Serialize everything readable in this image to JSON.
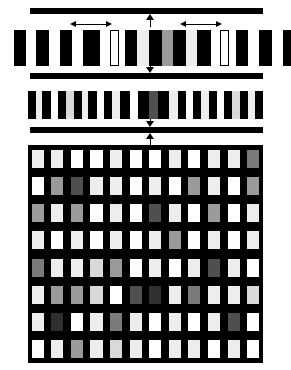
{
  "figure": {
    "background": "#ffffff",
    "width": 291,
    "height": 370,
    "palette": {
      "black": "#000000",
      "white": "#ffffff",
      "light_gray": "#d9d9d9",
      "pale_gray": "#ededed",
      "mid_gray": "#9a9a9a",
      "dark_gray": "#4f4f4f",
      "very_dark_gray": "#303030"
    }
  },
  "rule_bars": [
    {
      "name": "top-rule",
      "x": 30,
      "y": 8,
      "width": 233,
      "height": 6,
      "color": "#000000"
    },
    {
      "name": "mid-rule",
      "x": 30,
      "y": 73,
      "width": 233,
      "height": 6,
      "color": "#000000"
    },
    {
      "name": "low-rule",
      "x": 30,
      "y": 127,
      "width": 233,
      "height": 6,
      "color": "#000000"
    }
  ],
  "connectors": [
    {
      "name": "connector-top",
      "x": 146,
      "y": 14,
      "height": 13,
      "direction": "up"
    },
    {
      "name": "connector-middle",
      "x": 146,
      "y": 60,
      "height": 13,
      "direction": "down"
    },
    {
      "name": "connector-lower",
      "x": 146,
      "y": 113,
      "height": 14,
      "direction": "down"
    },
    {
      "name": "connector-grid",
      "x": 146,
      "y": 133,
      "height": 12,
      "direction": "up"
    }
  ],
  "span_arrows": [
    {
      "name": "span-arrow-left",
      "x": 70,
      "y": 21,
      "width": 42,
      "label": ""
    },
    {
      "name": "span-arrow-right",
      "x": 180,
      "y": 21,
      "width": 42,
      "label": ""
    }
  ],
  "row1": {
    "name": "coarse-stripe-row",
    "y": 30,
    "height": 36,
    "groups": [
      {
        "name": "row1-group-left",
        "x": 14,
        "width": 86,
        "bars": [
          {
            "w": 12,
            "color": "#000000"
          },
          {
            "w": 10,
            "color": "#ffffff"
          },
          {
            "w": 13,
            "color": "#000000"
          },
          {
            "w": 11,
            "color": "#ffffff"
          },
          {
            "w": 12,
            "color": "#000000"
          },
          {
            "w": 11,
            "color": "#ffffff"
          },
          {
            "w": 17,
            "color": "#000000"
          }
        ]
      },
      {
        "name": "row1-outline-bar-left",
        "x": 110,
        "width": 9,
        "outlined": true
      },
      {
        "name": "row1-group-center",
        "x": 125,
        "width": 86,
        "bars": [
          {
            "w": 12,
            "color": "#000000"
          },
          {
            "w": 12,
            "color": "#ededed"
          },
          {
            "w": 13,
            "color": "#000000"
          },
          {
            "w": 11,
            "color": "#9a9a9a"
          },
          {
            "w": 13,
            "color": "#000000"
          },
          {
            "w": 11,
            "color": "#ededed"
          },
          {
            "w": 14,
            "color": "#000000"
          }
        ]
      },
      {
        "name": "row1-outline-bar-right",
        "x": 220,
        "width": 9,
        "outlined": true
      },
      {
        "name": "row1-group-right",
        "x": 236,
        "width": 86,
        "bars": [
          {
            "w": 12,
            "color": "#000000"
          },
          {
            "w": 11,
            "color": "#ffffff"
          },
          {
            "w": 13,
            "color": "#000000"
          },
          {
            "w": 11,
            "color": "#ffffff"
          },
          {
            "w": 12,
            "color": "#000000"
          },
          {
            "w": 11,
            "color": "#d9d9d9"
          },
          {
            "w": 16,
            "color": "#000000"
          }
        ]
      }
    ]
  },
  "row2": {
    "name": "medium-stripe-row",
    "x": 28,
    "y": 91,
    "width": 235,
    "height": 28,
    "bars": [
      {
        "w": 8,
        "color": "#000000"
      },
      {
        "w": 7,
        "color": "#ededed"
      },
      {
        "w": 9,
        "color": "#000000"
      },
      {
        "w": 7,
        "color": "#ffffff"
      },
      {
        "w": 9,
        "color": "#000000"
      },
      {
        "w": 8,
        "color": "#d9d9d9"
      },
      {
        "w": 8,
        "color": "#000000"
      },
      {
        "w": 7,
        "color": "#ededed"
      },
      {
        "w": 9,
        "color": "#000000"
      },
      {
        "w": 7,
        "color": "#ffffff"
      },
      {
        "w": 9,
        "color": "#000000"
      },
      {
        "w": 8,
        "color": "#ededed"
      },
      {
        "w": 10,
        "color": "#000000"
      },
      {
        "w": 9,
        "color": "#ffffff"
      },
      {
        "w": 11,
        "color": "#000000"
      },
      {
        "w": 10,
        "color": "#4f4f4f"
      },
      {
        "w": 11,
        "color": "#000000"
      },
      {
        "w": 9,
        "color": "#ededed"
      },
      {
        "w": 9,
        "color": "#000000"
      },
      {
        "w": 7,
        "color": "#ffffff"
      },
      {
        "w": 9,
        "color": "#000000"
      },
      {
        "w": 8,
        "color": "#ededed"
      },
      {
        "w": 8,
        "color": "#000000"
      },
      {
        "w": 7,
        "color": "#ffffff"
      },
      {
        "w": 9,
        "color": "#000000"
      },
      {
        "w": 8,
        "color": "#d9d9d9"
      },
      {
        "w": 9,
        "color": "#000000"
      },
      {
        "w": 7,
        "color": "#ededed"
      },
      {
        "w": 8,
        "color": "#000000"
      }
    ]
  },
  "grid": {
    "name": "fine-cell-grid",
    "x": 28,
    "y": 145,
    "width": 235,
    "height": 218,
    "columns": 12,
    "rows": 8,
    "background": "#000000",
    "cells": [
      [
        "#ededed",
        "#ededed",
        "#ffffff",
        "#ffffff",
        "#ededed",
        "#ffffff",
        "#ffffff",
        "#ededed",
        "#ffffff",
        "#ededed",
        "#ededed",
        "#7a7a7a"
      ],
      [
        "#ffffff",
        "#9a9a9a",
        "#4f4f4f",
        "#ededed",
        "#ededed",
        "#ffffff",
        "#ededed",
        "#ffffff",
        "#9a9a9a",
        "#ededed",
        "#ffffff",
        "#9a9a9a"
      ],
      [
        "#9a9a9a",
        "#ededed",
        "#9a9a9a",
        "#ffffff",
        "#ededed",
        "#ffffff",
        "#4f4f4f",
        "#ededed",
        "#ffffff",
        "#9a9a9a",
        "#ffffff",
        "#ededed"
      ],
      [
        "#ededed",
        "#ffffff",
        "#ededed",
        "#ffffff",
        "#ededed",
        "#ffffff",
        "#ededed",
        "#9a9a9a",
        "#ffffff",
        "#ededed",
        "#ffffff",
        "#ededed"
      ],
      [
        "#7a7a7a",
        "#ededed",
        "#ededed",
        "#d9d9d9",
        "#9a9a9a",
        "#ffffff",
        "#ededed",
        "#ffffff",
        "#ededed",
        "#4f4f4f",
        "#ededed",
        "#ffffff"
      ],
      [
        "#ededed",
        "#9a9a9a",
        "#9a9a9a",
        "#d9d9d9",
        "#ffffff",
        "#4f4f4f",
        "#303030",
        "#ededed",
        "#7a7a7a",
        "#ededed",
        "#ededed",
        "#d9d9d9"
      ],
      [
        "#ededed",
        "#303030",
        "#ffffff",
        "#ededed",
        "#7a7a7a",
        "#ededed",
        "#ffffff",
        "#ededed",
        "#ffffff",
        "#ededed",
        "#4f4f4f",
        "#ffffff"
      ],
      [
        "#ffffff",
        "#ededed",
        "#9a9a9a",
        "#ededed",
        "#d9d9d9",
        "#ededed",
        "#ffffff",
        "#ededed",
        "#ededed",
        "#ffffff",
        "#ededed",
        "#ffffff"
      ]
    ]
  }
}
